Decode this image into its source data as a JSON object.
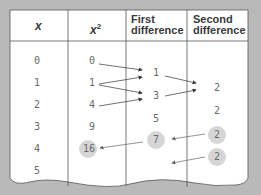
{
  "table": {
    "headers": {
      "x": "x",
      "x2_base": "x",
      "x2_exp": "2",
      "first_1": "First",
      "first_2": "difference",
      "second_1": "Second",
      "second_2": "difference"
    },
    "x_values": [
      "0",
      "1",
      "2",
      "3",
      "4",
      "5"
    ],
    "x2_values": [
      "0",
      "1",
      "4",
      "9",
      "16"
    ],
    "first_differences": [
      "1",
      "3",
      "5",
      "7"
    ],
    "second_differences": [
      "2",
      "2",
      "2",
      "2"
    ],
    "highlighted": [
      "16",
      "7",
      "2",
      "2"
    ]
  },
  "colors": {
    "background": "#b9b9b9",
    "paper": "#ffffff",
    "grid": "#555555",
    "text": "#6a6a6a",
    "highlight": "#d6d6d6"
  }
}
